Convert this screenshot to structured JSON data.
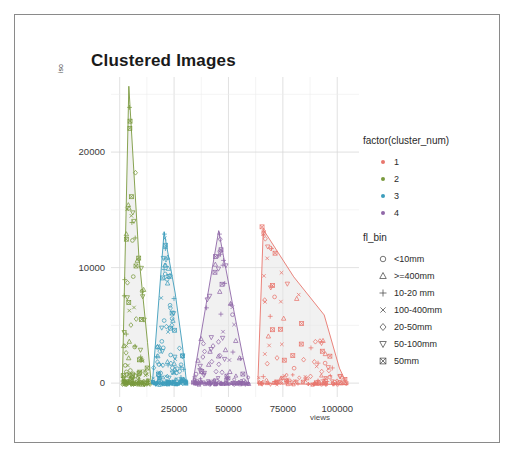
{
  "frame": {
    "border_color": "#8a8a8a",
    "background": "#ffffff"
  },
  "chart_data": {
    "type": "scatter",
    "title": "Clustered Images",
    "xlabel": "views",
    "ylabel": "iso",
    "xlim": [
      -4000,
      110000
    ],
    "ylim": [
      -1200,
      26500
    ],
    "xticks": [
      0,
      25000,
      50000,
      75000,
      100000
    ],
    "xtick_labels": [
      "0",
      "25000",
      "50000",
      "75000",
      "100000"
    ],
    "yticks": [
      0,
      10000,
      20000
    ],
    "ytick_labels": [
      "0",
      "10000",
      "20000"
    ],
    "grid": true,
    "grid_color": "#d9d9d9",
    "legend_position": "right",
    "color_legend_title": "factor(cluster_num)",
    "shape_legend_title": "fl_bin",
    "series": [
      {
        "name": "1",
        "color": "#e8766d",
        "hull": [
          [
            66000,
            13300
          ],
          [
            63500,
            -50
          ],
          [
            104500,
            -120
          ],
          [
            101000,
            1300
          ],
          [
            94000,
            5900
          ],
          [
            80000,
            9200
          ]
        ],
        "n_points": 150
      },
      {
        "name": "2",
        "color": "#7a9a3e",
        "hull": [
          [
            4200,
            25700
          ],
          [
            1200,
            -60
          ],
          [
            14500,
            -90
          ],
          [
            12800,
            3500
          ],
          [
            8800,
            11000
          ]
        ],
        "n_points": 150
      },
      {
        "name": "3",
        "color": "#3d9dbc",
        "hull": [
          [
            20400,
            13100
          ],
          [
            15000,
            -60
          ],
          [
            30800,
            -90
          ],
          [
            28800,
            3300
          ],
          [
            25500,
            7800
          ]
        ],
        "n_points": 150
      },
      {
        "name": "4",
        "color": "#9068a8",
        "hull": [
          [
            45500,
            13200
          ],
          [
            33500,
            -60
          ],
          [
            59500,
            -90
          ],
          [
            56500,
            2400
          ],
          [
            51500,
            7200
          ]
        ],
        "n_points": 150
      }
    ],
    "hull_fill": "#e6e6e6",
    "hull_fill_opacity": 0.55
  },
  "color_legend": {
    "title": "factor(cluster_num)",
    "items": [
      {
        "label": "1",
        "color": "#e8766d",
        "icon": "square-dot-icon"
      },
      {
        "label": "2",
        "color": "#7a9a3e",
        "icon": "square-dot-icon"
      },
      {
        "label": "3",
        "color": "#3d9dbc",
        "icon": "square-dot-icon"
      },
      {
        "label": "4",
        "color": "#9068a8",
        "icon": "square-dot-icon"
      }
    ]
  },
  "shape_legend": {
    "title": "fl_bin",
    "items": [
      {
        "label": "<10mm",
        "shape": "circle",
        "icon": "circle-marker-icon"
      },
      {
        "label": ">=400mm",
        "shape": "triangle-up",
        "icon": "triangle-up-marker-icon"
      },
      {
        "label": "10-20 mm",
        "shape": "plus",
        "icon": "plus-marker-icon"
      },
      {
        "label": "100-400mm",
        "shape": "cross",
        "icon": "cross-marker-icon"
      },
      {
        "label": "20-50mm",
        "shape": "diamond",
        "icon": "diamond-marker-icon"
      },
      {
        "label": "50-100mm",
        "shape": "triangle-down",
        "icon": "triangle-down-marker-icon"
      },
      {
        "label": "50mm",
        "shape": "square-crossed",
        "icon": "square-crossed-marker-icon"
      }
    ]
  }
}
